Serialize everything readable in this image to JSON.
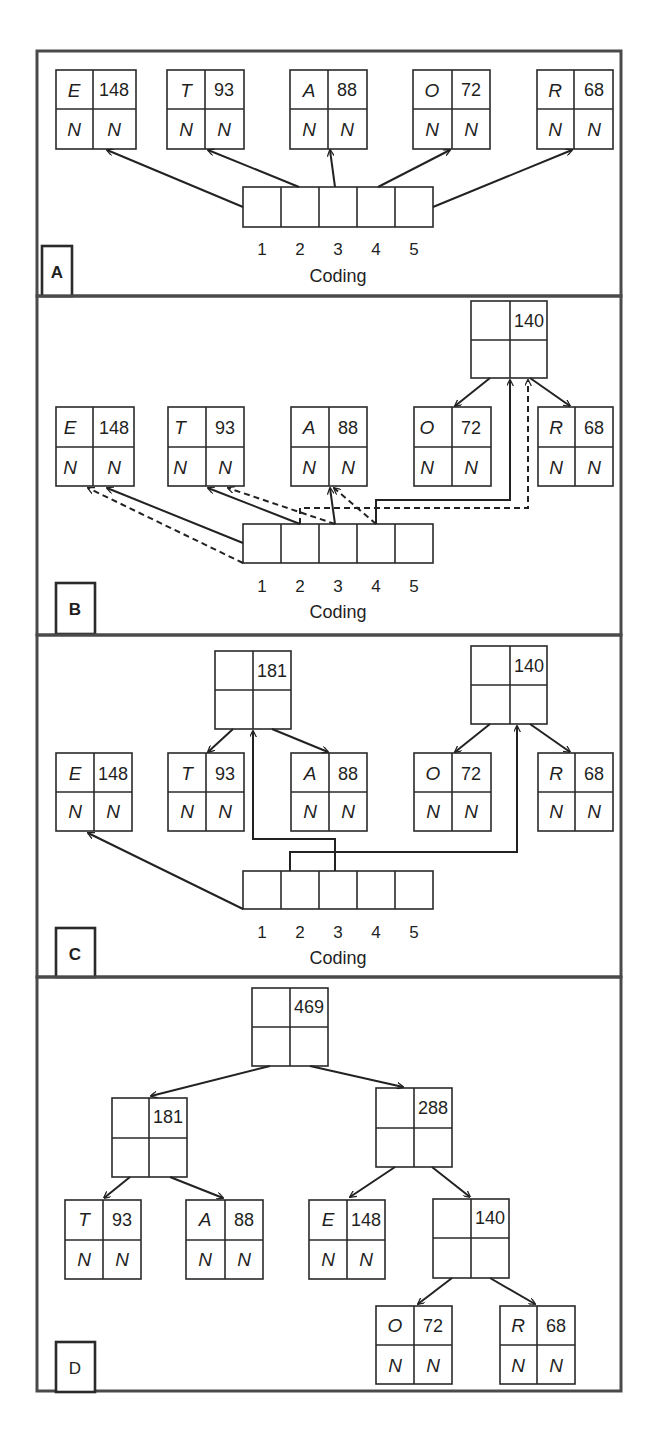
{
  "figure": {
    "coding_label": "Coding",
    "coding_slots": [
      "1",
      "2",
      "3",
      "4",
      "5"
    ],
    "null_marker": "N",
    "panels": [
      {
        "id": "A",
        "label": "A",
        "leaves": [
          {
            "symbol": "E",
            "weight": "148"
          },
          {
            "symbol": "T",
            "weight": "93"
          },
          {
            "symbol": "A",
            "weight": "88"
          },
          {
            "symbol": "O",
            "weight": "72"
          },
          {
            "symbol": "R",
            "weight": "68"
          }
        ],
        "internal_nodes": []
      },
      {
        "id": "B",
        "label": "B",
        "leaves": [
          {
            "symbol": "E",
            "weight": "148"
          },
          {
            "symbol": "T",
            "weight": "93"
          },
          {
            "symbol": "A",
            "weight": "88"
          },
          {
            "symbol": "O",
            "weight": "72"
          },
          {
            "symbol": "R",
            "weight": "68"
          }
        ],
        "internal_nodes": [
          {
            "weight": "140",
            "children": [
              "O",
              "R"
            ]
          }
        ]
      },
      {
        "id": "C",
        "label": "C",
        "leaves": [
          {
            "symbol": "E",
            "weight": "148"
          },
          {
            "symbol": "T",
            "weight": "93"
          },
          {
            "symbol": "A",
            "weight": "88"
          },
          {
            "symbol": "O",
            "weight": "72"
          },
          {
            "symbol": "R",
            "weight": "68"
          }
        ],
        "internal_nodes": [
          {
            "weight": "181",
            "children": [
              "T",
              "A"
            ]
          },
          {
            "weight": "140",
            "children": [
              "O",
              "R"
            ]
          }
        ]
      },
      {
        "id": "D",
        "label": "D",
        "root": {
          "weight": "469",
          "children": [
            "181",
            "288"
          ]
        },
        "internal_nodes": [
          {
            "weight": "181",
            "children": [
              "T",
              "A"
            ]
          },
          {
            "weight": "288",
            "children": [
              "E",
              "140"
            ]
          },
          {
            "weight": "140",
            "children": [
              "O",
              "R"
            ]
          }
        ],
        "leaves": [
          {
            "symbol": "T",
            "weight": "93"
          },
          {
            "symbol": "A",
            "weight": "88"
          },
          {
            "symbol": "E",
            "weight": "148"
          },
          {
            "symbol": "O",
            "weight": "72"
          },
          {
            "symbol": "R",
            "weight": "68"
          }
        ]
      }
    ]
  }
}
